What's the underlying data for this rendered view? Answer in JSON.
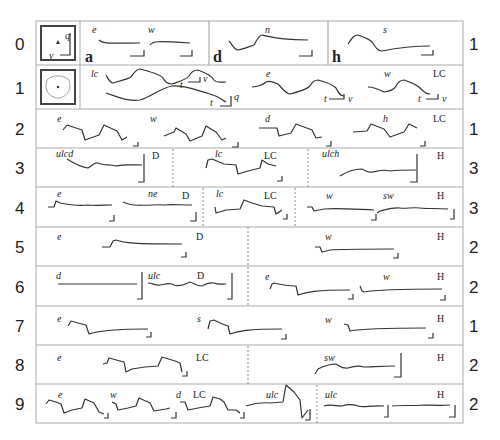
{
  "figure": {
    "rows": [
      {
        "index": "0",
        "count": "1",
        "panels": [
          {
            "trace_labels": [
              "e",
              "w"
            ],
            "panel_letter": "a"
          },
          {
            "trace_labels": [
              "n"
            ],
            "panel_letter": "d"
          },
          {
            "trace_labels": [
              "s"
            ],
            "panel_letter": "h"
          }
        ],
        "icon": "phase-plane-axes-icon",
        "axis_labels": {
          "q": "q",
          "v": "v"
        }
      },
      {
        "index": "1",
        "count": "1",
        "panels": [
          {
            "trace_labels": [
              "lc"
            ],
            "axis_labels": [
              "t",
              "v",
              "t",
              "q"
            ]
          },
          {
            "trace_labels": [
              "e"
            ],
            "axis_labels": [
              "t",
              "v"
            ]
          },
          {
            "trace_labels": [
              "w"
            ],
            "class": "LC",
            "axis_labels": [
              "t",
              "v"
            ]
          }
        ],
        "icon": "limit-cycle-orbit-icon"
      },
      {
        "index": "2",
        "count": "1",
        "panels": [
          {
            "trace_labels": [
              "e",
              "w",
              "d",
              "h"
            ],
            "class": "LC"
          }
        ]
      },
      {
        "index": "3",
        "count": "3",
        "panels": [
          {
            "trace_labels": [
              "ulcd"
            ],
            "class": "D"
          },
          {
            "trace_labels": [
              "lc"
            ],
            "class": "LC"
          },
          {
            "trace_labels": [
              "ulch"
            ],
            "class": "H"
          }
        ]
      },
      {
        "index": "4",
        "count": "3",
        "panels": [
          {
            "trace_labels": [
              "e",
              "ne"
            ],
            "class": "D"
          },
          {
            "trace_labels": [
              "lc"
            ],
            "class": "LC"
          },
          {
            "trace_labels": [
              "w",
              "sw"
            ],
            "class": "H"
          }
        ]
      },
      {
        "index": "5",
        "count": "2",
        "panels": [
          {
            "trace_labels": [
              "e"
            ],
            "class": "D"
          },
          {
            "trace_labels": [
              "w"
            ],
            "class": "H"
          }
        ]
      },
      {
        "index": "6",
        "count": "2",
        "panels": [
          {
            "trace_labels": [
              "d",
              "ulc"
            ],
            "class": "D"
          },
          {
            "trace_labels": [
              "e",
              "w"
            ],
            "class": "H"
          }
        ]
      },
      {
        "index": "7",
        "count": "1",
        "panels": [
          {
            "trace_labels": [
              "e",
              "s",
              "w"
            ],
            "class": "H"
          }
        ]
      },
      {
        "index": "8",
        "count": "2",
        "panels": [
          {
            "trace_labels": [
              "e"
            ],
            "class": "LC"
          },
          {
            "trace_labels": [
              "sw"
            ],
            "class": "H"
          }
        ]
      },
      {
        "index": "9",
        "count": "2",
        "panels": [
          {
            "trace_labels": [
              "e",
              "w",
              "d",
              "ulc"
            ],
            "class": "LC"
          },
          {
            "trace_labels": [
              "ulc"
            ],
            "class": "H"
          }
        ]
      }
    ],
    "colors": {
      "trace": "#333333",
      "grid": "#aaaaaa",
      "text": "#222222"
    }
  }
}
